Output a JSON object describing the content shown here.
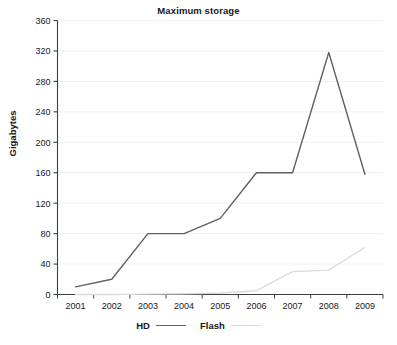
{
  "chart_data": {
    "type": "line",
    "title": "Maximum storage",
    "xlabel": "",
    "ylabel": "Gigabytes",
    "categories": [
      "2001",
      "2002",
      "2003",
      "2004",
      "2005",
      "2006",
      "2007",
      "2008",
      "2009"
    ],
    "series": [
      {
        "name": "HD",
        "color": "#5d6266",
        "values": [
          10,
          20,
          80,
          80,
          100,
          160,
          160,
          318,
          158
        ]
      },
      {
        "name": "Flash",
        "color": "#d9dcde",
        "values": [
          0,
          0,
          0.5,
          1,
          2,
          5,
          30,
          32,
          62
        ]
      }
    ],
    "ylim": [
      0,
      360
    ],
    "yticks": [
      0,
      40,
      80,
      120,
      160,
      200,
      240,
      280,
      320,
      360
    ],
    "ytick_labels": [
      "0",
      "40",
      "80",
      "120",
      "160",
      "200",
      "240",
      "280",
      "320",
      "360"
    ],
    "grid": true,
    "grid_color": "#eef0f1",
    "legend_position": "bottom"
  },
  "legend": {
    "entries": [
      {
        "label": "HD"
      },
      {
        "label": "Flash"
      }
    ]
  }
}
